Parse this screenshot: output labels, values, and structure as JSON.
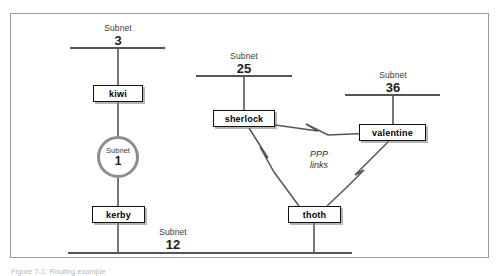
{
  "figure": {
    "caption": "Figure 7-1: Routing example",
    "frame_color": "#9a9a9a"
  },
  "diagram": {
    "type": "network-topology",
    "background": "#ffffff",
    "line_color": "#555555",
    "box_border_color": "#111111",
    "ring_color": "#8d8d8d",
    "subnets": [
      {
        "id": "subnet-3",
        "word": "Subnet",
        "number": "3",
        "style": "bus",
        "x": 70,
        "y": 48,
        "width": 95
      },
      {
        "id": "subnet-25",
        "word": "Subnet",
        "number": "25",
        "style": "bus",
        "x": 196,
        "y": 76,
        "width": 96
      },
      {
        "id": "subnet-36",
        "word": "Subnet",
        "number": "36",
        "style": "bus",
        "x": 345,
        "y": 95,
        "width": 95
      },
      {
        "id": "subnet-12",
        "word": "Subnet",
        "number": "12",
        "style": "bus",
        "x": 68,
        "y": 253,
        "width": 284
      },
      {
        "id": "subnet-1",
        "word": "Subnet",
        "number": "1",
        "style": "ring",
        "x": 118,
        "y": 157,
        "radius": 21
      }
    ],
    "hosts": [
      {
        "id": "kiwi",
        "label": "kiwi",
        "x": 118,
        "y": 93
      },
      {
        "id": "kerby",
        "label": "kerby",
        "x": 118,
        "y": 214
      },
      {
        "id": "sherlock",
        "label": "sherlock",
        "x": 244,
        "y": 118
      },
      {
        "id": "valentine",
        "label": "valentine",
        "x": 393,
        "y": 132
      },
      {
        "id": "thoth",
        "label": "thoth",
        "x": 314,
        "y": 214
      }
    ],
    "links": {
      "ppp_label": "PPP\nlinks",
      "ppp_label_line1": "PPP",
      "ppp_label_line2": "links",
      "ppp_connections": [
        {
          "from": "sherlock",
          "to": "valentine"
        },
        {
          "from": "sherlock",
          "to": "thoth"
        },
        {
          "from": "valentine",
          "to": "thoth"
        }
      ],
      "bus_connections": [
        {
          "host": "kiwi",
          "subnet": "subnet-3"
        },
        {
          "host": "kiwi",
          "subnet": "subnet-1"
        },
        {
          "host": "kerby",
          "subnet": "subnet-1"
        },
        {
          "host": "kerby",
          "subnet": "subnet-12"
        },
        {
          "host": "sherlock",
          "subnet": "subnet-25"
        },
        {
          "host": "valentine",
          "subnet": "subnet-36"
        },
        {
          "host": "thoth",
          "subnet": "subnet-12"
        }
      ]
    }
  }
}
